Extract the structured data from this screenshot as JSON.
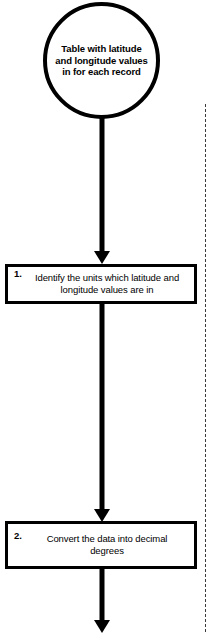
{
  "diagram": {
    "background_color": "#ffffff",
    "stroke_color": "#000000",
    "nodes": [
      {
        "id": "start",
        "shape": "circle",
        "text": "Table with latitude and longitude values in for each record",
        "lines": [
          "Table with",
          "latitude and",
          "longitude values",
          "in for each",
          "record"
        ]
      },
      {
        "id": "step-1",
        "shape": "rectangle",
        "number": "1.",
        "text": "Identify the units which latitude and longitude values are in"
      },
      {
        "id": "step-2",
        "shape": "rectangle",
        "number": "2.",
        "text": "Convert the data into decimal degrees"
      }
    ],
    "connectors": [
      {
        "id": "arrow-1",
        "from": "start",
        "to": "step-1",
        "direction": "down",
        "style": "solid-arrow"
      },
      {
        "id": "arrow-2",
        "from": "step-1",
        "to": "step-2",
        "direction": "down",
        "style": "solid-arrow"
      },
      {
        "id": "arrow-3",
        "from": "step-2",
        "to": "next",
        "direction": "down",
        "style": "solid-arrow"
      }
    ],
    "guides": [
      {
        "id": "right-edge-guide",
        "orientation": "vertical",
        "style": "dashed",
        "color": "#3a3a3a"
      }
    ]
  }
}
